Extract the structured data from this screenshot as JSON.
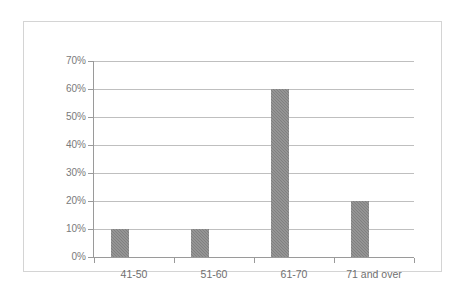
{
  "chart_data": {
    "type": "bar",
    "title": "",
    "subtitle": "",
    "xlabel": "",
    "ylabel": "",
    "categories": [
      "41-50",
      "51-60",
      "61-70",
      "71 and over"
    ],
    "values": [
      10,
      10,
      60,
      20
    ],
    "value_suffix": "%",
    "ylim": [
      0,
      70
    ],
    "ytick_step": 10,
    "ytick_labels": [
      "0%",
      "10%",
      "20%",
      "30%",
      "40%",
      "50%",
      "60%",
      "70%"
    ],
    "ytick_values": [
      0,
      10,
      20,
      30,
      40,
      50,
      60,
      70
    ],
    "grid": true,
    "legend": false,
    "legend_position": "none",
    "series": [
      {
        "name": "",
        "values": [
          10,
          10,
          60,
          20
        ]
      }
    ]
  },
  "style": {
    "bar_color": "#808080",
    "gridline_color": "#bfbfbf",
    "axis_color": "#9a9a9a",
    "label_color": "#6f6f6f",
    "frame_color": "#d4d4d4",
    "background": "#ffffff"
  }
}
